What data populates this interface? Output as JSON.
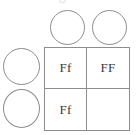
{
  "diagram": {
    "type": "punnett-square",
    "top_gametes": [
      {
        "label": "",
        "filled": false
      },
      {
        "label": "",
        "filled": false
      }
    ],
    "left_gametes": [
      {
        "label": "",
        "filled": false
      },
      {
        "label": "",
        "filled": false
      }
    ],
    "grid": {
      "rows": 2,
      "columns": 2,
      "cells": [
        {
          "position": "top-left",
          "genotype": "Ff"
        },
        {
          "position": "top-right",
          "genotype": "FF"
        },
        {
          "position": "bottom-left",
          "genotype": "Ff"
        },
        {
          "position": "bottom-right",
          "genotype": ""
        }
      ]
    },
    "colors": {
      "stroke": "#8d8d8d",
      "text": "#3a3a3a",
      "background": "#ffffff"
    }
  }
}
